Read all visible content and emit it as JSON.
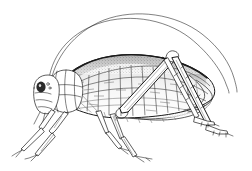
{
  "image": {
    "kind": "line-art-illustration",
    "subject": "katydid",
    "subject_alt": "long-horned grasshopper",
    "view": "lateral left-facing",
    "technique": "pen-and-ink stipple and hatch engraving",
    "width": 252,
    "height": 171
  },
  "colors": {
    "background": "#ffffff",
    "ink": "#1a1a1a",
    "vein": "#3a3a3a",
    "vein_faint": "#6a6a6a",
    "shade_light": "#d9d9d9",
    "shade_mid": "#c2c2c2",
    "shade_dark": "#2b2b2b"
  },
  "anatomy": {
    "parts": [
      {
        "name": "antenna-left",
        "label": "Antenna (near)"
      },
      {
        "name": "antenna-right",
        "label": "Antenna (far)"
      },
      {
        "name": "head",
        "label": "Head"
      },
      {
        "name": "compound-eye",
        "label": "Compound eye"
      },
      {
        "name": "pronotum",
        "label": "Pronotum"
      },
      {
        "name": "tegmen",
        "label": "Forewing (tegmen)"
      },
      {
        "name": "wing-venation",
        "label": "Reticulate venation"
      },
      {
        "name": "foreleg",
        "label": "Foreleg"
      },
      {
        "name": "midleg",
        "label": "Midleg"
      },
      {
        "name": "hindleg-femur",
        "label": "Hind femur"
      },
      {
        "name": "hindleg-tibia",
        "label": "Hind tibia"
      },
      {
        "name": "tarsus",
        "label": "Tarsus"
      },
      {
        "name": "abdomen",
        "label": "Abdomen"
      }
    ]
  },
  "caption": {
    "title": "Katydid",
    "text": ""
  }
}
